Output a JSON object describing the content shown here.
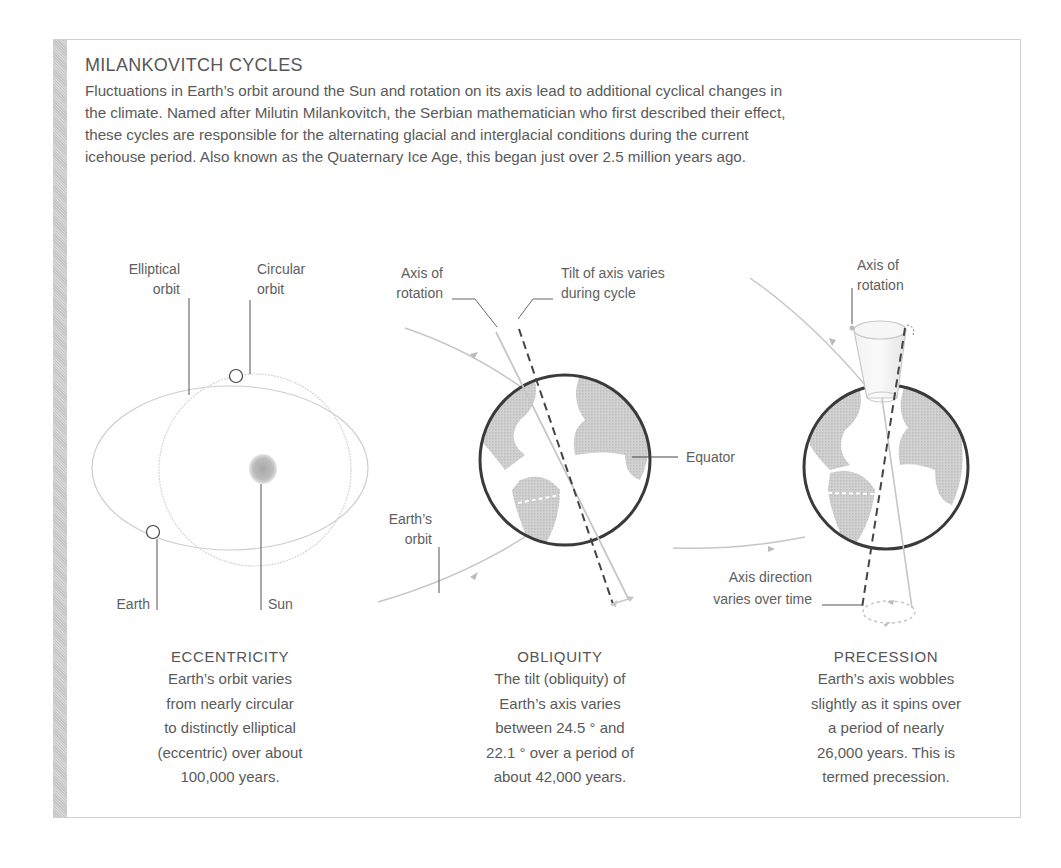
{
  "header": {
    "title": "MILANKOVITCH CYCLES",
    "intro": "Fluctuations in Earth’s orbit around the Sun and rotation on its axis lead to additional cyclical changes in the climate. Named after Milutin Milankovitch, the Serbian mathematician who first described their effect, these cycles are responsible for the alternating glacial and interglacial conditions during the current icehouse period. Also known as the Quaternary Ice Age, this began just over 2.5 million years ago."
  },
  "eccentricity": {
    "labels": {
      "elliptical_1": "Elliptical",
      "elliptical_2": "orbit",
      "circular_1": "Circular",
      "circular_2": "orbit",
      "earth": "Earth",
      "sun": "Sun"
    },
    "caption_title": "ECCENTRICITY",
    "caption_lines": [
      "Earth’s orbit varies",
      "from nearly circular",
      "to distinctly elliptical",
      "(eccentric) over about",
      "100,000 years."
    ]
  },
  "obliquity": {
    "labels": {
      "axis_1": "Axis of",
      "axis_2": "rotation",
      "tilt_1": "Tilt of axis varies",
      "tilt_2": "during cycle",
      "equator": "Equator",
      "orbit_1": "Earth’s",
      "orbit_2": "orbit"
    },
    "caption_title": "OBLIQUITY",
    "caption_lines": [
      "The tilt (obliquity) of",
      "Earth’s axis varies",
      "between 24.5 ° and",
      "22.1 ° over a period of",
      "about 42,000 years."
    ]
  },
  "precession": {
    "labels": {
      "axis_1": "Axis of",
      "axis_2": "rotation",
      "direction_1": "Axis direction",
      "direction_2": "varies over time"
    },
    "caption_title": "PRECESSION",
    "caption_lines": [
      "Earth’s axis wobbles",
      "slightly as it spins over",
      "a period of nearly",
      "26,000 years. This is",
      "termed precession."
    ]
  },
  "colors": {
    "text": "#5a5a5a",
    "globe_outline": "#3a3a3a",
    "land": "#c8c8c8",
    "orbit": "#c4c4c4",
    "axis_dashed": "#444444",
    "hatch": "#cccccc"
  }
}
